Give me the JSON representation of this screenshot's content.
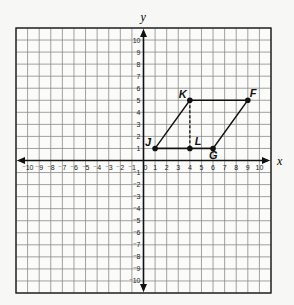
{
  "chart_data": {
    "type": "scatter",
    "title": "",
    "xlabel": "x",
    "ylabel": "y",
    "xlim": [
      -11,
      11
    ],
    "ylim": [
      -11,
      11
    ],
    "grid": true,
    "x_ticks": [
      -10,
      -9,
      -8,
      -7,
      -6,
      -5,
      -4,
      -3,
      -2,
      -1,
      0,
      1,
      2,
      3,
      4,
      5,
      6,
      7,
      8,
      9,
      10
    ],
    "y_ticks": [
      -10,
      -9,
      -8,
      -7,
      -6,
      -5,
      -4,
      -3,
      -2,
      -1,
      1,
      2,
      3,
      4,
      5,
      6,
      7,
      8,
      9,
      10
    ],
    "points": [
      {
        "label": "J",
        "x": 1,
        "y": 1
      },
      {
        "label": "L",
        "x": 4,
        "y": 1
      },
      {
        "label": "G",
        "x": 6,
        "y": 1
      },
      {
        "label": "K",
        "x": 4,
        "y": 5
      },
      {
        "label": "F",
        "x": 9,
        "y": 5
      }
    ],
    "polygon": {
      "name": "parallelogram JKFG",
      "vertices": [
        "J",
        "K",
        "F",
        "G"
      ]
    },
    "segments": [
      {
        "from": "J",
        "to": "G",
        "style": "solid"
      },
      {
        "from": "K",
        "to": "L",
        "style": "dashed"
      }
    ]
  },
  "axes": {
    "x_label": "x",
    "y_label": "y"
  }
}
